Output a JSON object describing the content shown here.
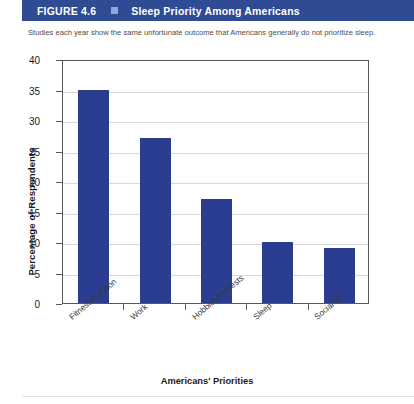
{
  "header": {
    "figure_number": "FIGURE 4.6",
    "marker": "square-marker",
    "title": "Sleep Priority Among Americans",
    "bar_color": "#2f4b93",
    "marker_color": "#8fa9dd"
  },
  "caption": "Studies each year show the same unfortunate outcome that Americans generally do not prioritize sleep.",
  "chart_data": {
    "type": "bar",
    "title": "Sleep Priority Among Americans",
    "subtitle": "Studies each year show the same unfortunate outcome that Americans generally do not prioritize sleep.",
    "categories": [
      "Fitness/nutrition",
      "Work",
      "Hobbies/interests",
      "Sleep",
      "Social life"
    ],
    "values": [
      35,
      27,
      17,
      10,
      9
    ],
    "xlabel": "Americans' Priorities",
    "ylabel": "Percentage of Respondents",
    "ylim": [
      0,
      40
    ],
    "yticks": [
      0,
      5,
      10,
      15,
      20,
      25,
      30,
      35,
      40
    ],
    "grid": true,
    "legend": "none",
    "bar_color": "#2b3d91"
  }
}
